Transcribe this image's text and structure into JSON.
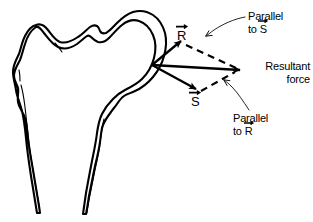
{
  "figure": {
    "background_color": "#ffffff",
    "ink_color": "#000000"
  },
  "anatomy": {
    "name": "proximal-femur",
    "parts": [
      "femoral head",
      "femoral neck",
      "greater trochanter",
      "lesser trochanter",
      "femoral shaft"
    ]
  },
  "vectors": {
    "origin_label": "",
    "r": {
      "symbol": "R",
      "accent": "arrow-right",
      "description": "component vector R directed up and to the right"
    },
    "s": {
      "symbol": "S",
      "accent": "arrow-right",
      "description": "component vector S directed down and to the right"
    },
    "resultant": {
      "line1": "Resultant",
      "line2": "force",
      "description": "resultant force vector directed right and slightly down"
    }
  },
  "annotations": [
    {
      "id": "parallel-to-s",
      "line1": "Parallel",
      "line2_prefix": "to ",
      "line2_symbol": "S",
      "accent": "arrow-right"
    },
    {
      "id": "parallel-to-r",
      "line1": "Parallel",
      "line2_prefix": "to ",
      "line2_symbol": "R",
      "accent": "arrow-right"
    }
  ]
}
